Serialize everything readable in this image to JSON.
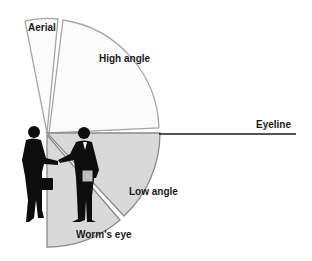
{
  "diagram": {
    "labels": {
      "aerial": "Aerial",
      "high_angle": "High angle",
      "eyeline": "Eyeline",
      "low_angle": "Low angle",
      "worms_eye": "Worm's eye"
    },
    "colors": {
      "upper_fill": "#fbfbfb",
      "lower_fill": "#d9d9d9",
      "stroke": "#9a9a9a",
      "eyeline": "#1a1a1a",
      "silhouette": "#0d0d0d"
    },
    "figures": "two businessmen shaking hands (silhouette)"
  }
}
